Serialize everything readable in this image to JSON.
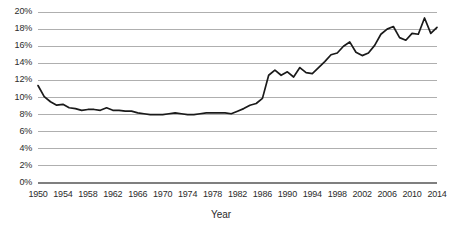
{
  "chart_data": {
    "type": "line",
    "title": "",
    "subtitle": "",
    "xlabel": "Year",
    "ylabel": "",
    "grid": true,
    "legend": false,
    "legend_position": "none",
    "line_color": "#1a1a1a",
    "gridline_color": "#a6a6a6",
    "axis_color": "#7f7f7f",
    "background_color": "#ffffff",
    "xlim": [
      1950,
      2014
    ],
    "ylim": [
      0,
      20
    ],
    "y_tick_labels": [
      "0%",
      "2%",
      "4%",
      "6%",
      "8%",
      "10%",
      "12%",
      "14%",
      "16%",
      "18%",
      "20%"
    ],
    "y_tick_values": [
      0,
      2,
      4,
      6,
      8,
      10,
      12,
      14,
      16,
      18,
      20
    ],
    "x_tick_labels": [
      "1950",
      "1954",
      "1958",
      "1962",
      "1966",
      "1970",
      "1974",
      "1978",
      "1982",
      "1986",
      "1990",
      "1994",
      "1998",
      "2002",
      "2006",
      "2010",
      "2014"
    ],
    "x_tick_values": [
      1950,
      1954,
      1958,
      1962,
      1966,
      1970,
      1974,
      1978,
      1982,
      1986,
      1990,
      1994,
      1998,
      2002,
      2006,
      2010,
      2014
    ],
    "x": [
      1950,
      1951,
      1952,
      1953,
      1954,
      1955,
      1956,
      1957,
      1958,
      1959,
      1960,
      1961,
      1962,
      1963,
      1964,
      1965,
      1966,
      1967,
      1968,
      1969,
      1970,
      1971,
      1972,
      1973,
      1974,
      1975,
      1976,
      1977,
      1978,
      1979,
      1980,
      1981,
      1982,
      1983,
      1984,
      1985,
      1986,
      1987,
      1988,
      1989,
      1990,
      1991,
      1992,
      1993,
      1994,
      1995,
      1996,
      1997,
      1998,
      1999,
      2000,
      2001,
      2002,
      2003,
      2004,
      2005,
      2006,
      2007,
      2008,
      2009,
      2010,
      2011,
      2012,
      2013,
      2014
    ],
    "values": [
      11.4,
      10.1,
      9.5,
      9.1,
      9.2,
      8.8,
      8.7,
      8.5,
      8.6,
      8.6,
      8.5,
      8.8,
      8.5,
      8.5,
      8.4,
      8.4,
      8.2,
      8.1,
      8.0,
      8.0,
      8.0,
      8.1,
      8.2,
      8.1,
      8.0,
      8.0,
      8.1,
      8.2,
      8.2,
      8.2,
      8.2,
      8.1,
      8.4,
      8.7,
      9.1,
      9.3,
      9.9,
      12.6,
      13.2,
      12.6,
      13.0,
      12.4,
      13.5,
      12.9,
      12.8,
      13.5,
      14.2,
      15.0,
      15.2,
      16.0,
      16.5,
      15.3,
      14.9,
      15.2,
      16.1,
      17.4,
      18.0,
      18.3,
      17.0,
      16.7,
      17.5,
      17.4,
      19.3,
      17.5,
      18.2
    ],
    "annotations": []
  }
}
